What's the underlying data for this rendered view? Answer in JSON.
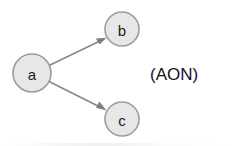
{
  "diagram": {
    "type": "activity-on-node-network",
    "caption": "(AON)",
    "caption_position": {
      "x": 150,
      "y": 74
    },
    "background_color": "#ffffff",
    "node_fill_color": "#e7e7e7",
    "node_stroke_color": "#9c9c9c",
    "edge_color": "#8a8a8a",
    "label_color": "#1c1c1c",
    "nodes": [
      {
        "id": "a",
        "label": "a",
        "cx": 32,
        "cy": 73,
        "r": 19
      },
      {
        "id": "b",
        "label": "b",
        "cx": 122,
        "cy": 29,
        "r": 17
      },
      {
        "id": "c",
        "label": "c",
        "cx": 122,
        "cy": 119,
        "r": 17
      }
    ],
    "edges": [
      {
        "from": "a",
        "to": "b",
        "x1": 49,
        "y1": 65,
        "x2": 104,
        "y2": 38
      },
      {
        "from": "a",
        "to": "c",
        "x1": 49,
        "y1": 82,
        "x2": 104,
        "y2": 110
      }
    ]
  }
}
